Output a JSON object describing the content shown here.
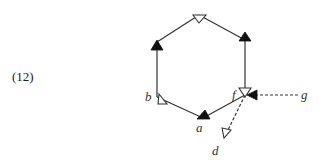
{
  "equation_number": "(12)",
  "diagram": {
    "type": "hexagonal quiver with arrows",
    "vertices": [
      {
        "id": "top",
        "label": ""
      },
      {
        "id": "upper-right",
        "label": ""
      },
      {
        "id": "f",
        "label": "f"
      },
      {
        "id": "a",
        "label": "a"
      },
      {
        "id": "b",
        "label": "b"
      },
      {
        "id": "upper-left",
        "label": ""
      }
    ],
    "external_nodes": [
      {
        "id": "g",
        "label": "g"
      },
      {
        "id": "d",
        "label": "d"
      }
    ],
    "edges": [
      {
        "from": "upper-left",
        "to": "top",
        "style": "solid",
        "arrowhead": "open"
      },
      {
        "from": "top",
        "to": "upper-right",
        "style": "solid",
        "arrowhead": "filled"
      },
      {
        "from": "upper-right",
        "to": "f",
        "style": "solid",
        "arrowhead": "open"
      },
      {
        "from": "f",
        "to": "a",
        "style": "solid",
        "arrowhead": "filled"
      },
      {
        "from": "a",
        "to": "b",
        "style": "solid",
        "arrowhead": "open"
      },
      {
        "from": "b",
        "to": "upper-left",
        "style": "solid",
        "arrowhead": "filled"
      },
      {
        "from": "g",
        "to": "f",
        "style": "dashed",
        "arrowhead": "filled"
      },
      {
        "from": "f",
        "to": "d",
        "style": "dashed",
        "arrowhead": "open"
      }
    ]
  },
  "labels": {
    "a": "a",
    "b": "b",
    "d": "d",
    "f": "f",
    "g": "g"
  },
  "colors": {
    "stroke": "#333333",
    "fill_arrow": "#111111",
    "open_arrow_fill": "#ffffff"
  }
}
